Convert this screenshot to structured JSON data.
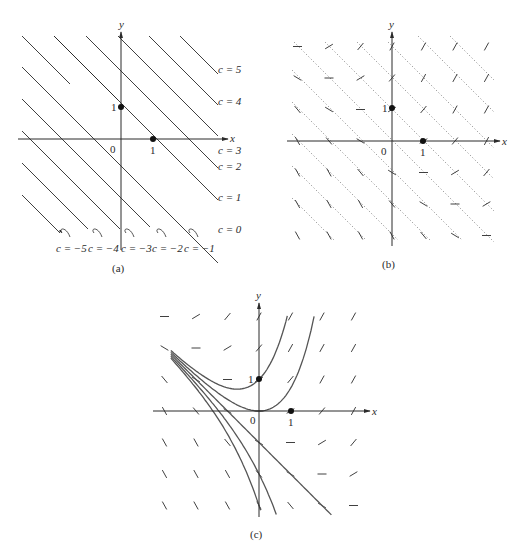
{
  "figure": {
    "panels": [
      {
        "id": "a",
        "caption": "(a)",
        "axis_x_label": "x",
        "axis_y_label": "y",
        "origin_label": "0",
        "x_tick_label": "1",
        "y_tick_label": "1",
        "right_labels": [
          "c = 5",
          "c = 4",
          "c = 3",
          "c = 2",
          "c = 1",
          "c = 0"
        ],
        "bottom_labels": [
          "c = −5",
          "c = −4",
          "c = −3",
          "c = −2",
          "c = −1"
        ]
      },
      {
        "id": "b",
        "caption": "(b)",
        "axis_x_label": "x",
        "axis_y_label": "y",
        "origin_label": "0",
        "x_tick_label": "1",
        "y_tick_label": "1"
      },
      {
        "id": "c",
        "caption": "(c)",
        "axis_x_label": "x",
        "axis_y_label": "y",
        "origin_label": "0",
        "x_tick_label": "1",
        "y_tick_label": "1"
      }
    ],
    "colors": {
      "ink": "#2a2a2a",
      "curve": "#555555",
      "dotted": "#888888"
    }
  }
}
